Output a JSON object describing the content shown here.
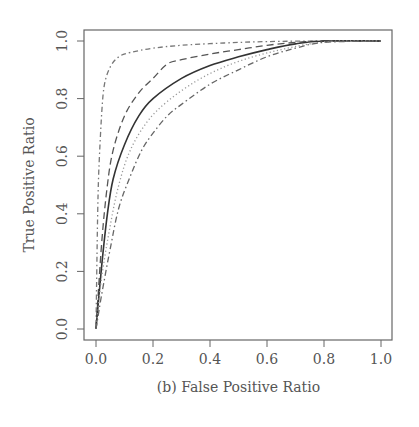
{
  "chart_data": {
    "type": "line",
    "title": "",
    "caption": "(b) False Positive Ratio",
    "xlabel": "(b) False Positive Ratio",
    "ylabel": "True Positive Ratio",
    "xlim": [
      0,
      1
    ],
    "ylim": [
      0,
      1
    ],
    "grid": false,
    "legend": null,
    "xticks": [
      "0.0",
      "0.2",
      "0.4",
      "0.6",
      "0.8",
      "1.0"
    ],
    "yticks": [
      "0.0",
      "0.2",
      "0.4",
      "0.6",
      "0.8",
      "1.0"
    ],
    "series": [
      {
        "name": "curve-dotdash-top",
        "style": "dot-dash",
        "color": "#777777",
        "x": [
          0.0,
          0.005,
          0.01,
          0.02,
          0.03,
          0.05,
          0.08,
          0.12,
          0.2,
          0.3,
          0.45,
          0.6,
          0.8,
          1.0
        ],
        "y": [
          0.0,
          0.35,
          0.55,
          0.75,
          0.85,
          0.91,
          0.945,
          0.96,
          0.975,
          0.985,
          0.993,
          0.998,
          1.0,
          1.0
        ]
      },
      {
        "name": "curve-dashed",
        "style": "dashed",
        "color": "#555555",
        "x": [
          0.0,
          0.02,
          0.04,
          0.06,
          0.1,
          0.15,
          0.2,
          0.25,
          0.3,
          0.4,
          0.5,
          0.6,
          0.7,
          0.8,
          1.0
        ],
        "y": [
          0.0,
          0.3,
          0.5,
          0.62,
          0.74,
          0.82,
          0.87,
          0.92,
          0.935,
          0.955,
          0.97,
          0.985,
          0.995,
          1.0,
          1.0
        ]
      },
      {
        "name": "curve-solid",
        "style": "solid",
        "color": "#333333",
        "x": [
          0.0,
          0.02,
          0.04,
          0.06,
          0.1,
          0.15,
          0.2,
          0.3,
          0.4,
          0.5,
          0.6,
          0.7,
          0.8,
          1.0
        ],
        "y": [
          0.0,
          0.22,
          0.4,
          0.52,
          0.64,
          0.74,
          0.8,
          0.87,
          0.915,
          0.945,
          0.97,
          0.99,
          1.0,
          1.0
        ]
      },
      {
        "name": "curve-dotted",
        "style": "dotted",
        "color": "#999999",
        "x": [
          0.0,
          0.02,
          0.05,
          0.08,
          0.12,
          0.18,
          0.25,
          0.35,
          0.45,
          0.55,
          0.65,
          0.75,
          0.85,
          1.0
        ],
        "y": [
          0.0,
          0.18,
          0.36,
          0.5,
          0.62,
          0.72,
          0.79,
          0.86,
          0.91,
          0.945,
          0.97,
          0.99,
          1.0,
          1.0
        ]
      },
      {
        "name": "curve-dashdot-low",
        "style": "long-dash-dot",
        "color": "#666666",
        "x": [
          0.0,
          0.02,
          0.05,
          0.08,
          0.12,
          0.16,
          0.2,
          0.25,
          0.3,
          0.4,
          0.5,
          0.6,
          0.7,
          0.8,
          1.0
        ],
        "y": [
          0.0,
          0.12,
          0.28,
          0.42,
          0.53,
          0.62,
          0.68,
          0.74,
          0.78,
          0.85,
          0.9,
          0.945,
          0.975,
          0.995,
          1.0
        ]
      }
    ]
  },
  "plot_geometry": {
    "box": {
      "left": 84,
      "top": 30,
      "right": 392,
      "bottom": 340
    },
    "x0_px": 96,
    "x1_px": 381,
    "y0_px": 329,
    "y1_px": 41
  }
}
